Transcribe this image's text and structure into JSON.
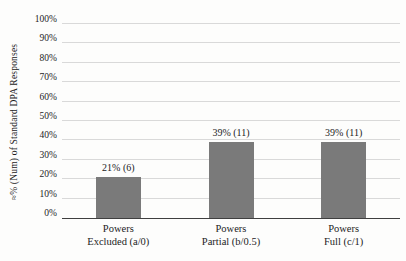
{
  "chart_data": {
    "type": "bar",
    "title": "",
    "xlabel": "",
    "ylabel": "≈% (Num) of Standard DPA Responses",
    "ylim": [
      0,
      100
    ],
    "ytick_step": 10,
    "ytick_labels": [
      "0%",
      "10%",
      "20%",
      "30%",
      "40%",
      "50%",
      "60%",
      "70%",
      "80%",
      "90%",
      "100%"
    ],
    "grid": true,
    "legend_position": "none",
    "categories": [
      {
        "line1": "Powers",
        "line2": "Excluded (a/0)"
      },
      {
        "line1": "Powers",
        "line2": "Partial (b/0.5)"
      },
      {
        "line1": "Powers",
        "line2": "Full (c/1)"
      }
    ],
    "series": [
      {
        "values": [
          21,
          39,
          39
        ],
        "counts": [
          6,
          11,
          11
        ],
        "point_labels": [
          "21% (6)",
          "39% (11)",
          "39% (11)"
        ]
      }
    ],
    "colors": {
      "bar": "#7a7a7a",
      "gridline": "#d9d9d9",
      "axis_line": "#3f3f3f",
      "text": "#1c1c1c",
      "background": "#fdfdfc"
    }
  }
}
